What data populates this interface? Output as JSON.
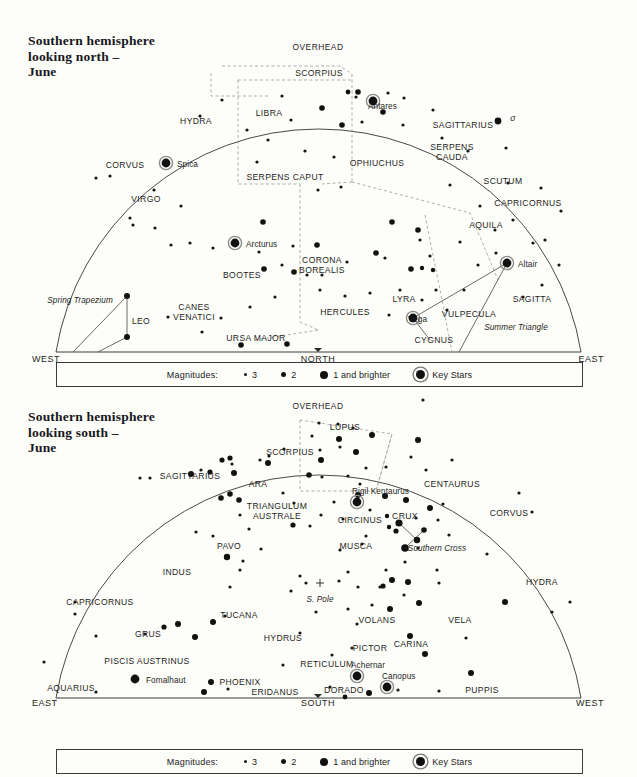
{
  "page": {
    "background": "#fdfdfa",
    "ink": "#1a1a1a"
  },
  "legend": {
    "title": "Magnitudes:",
    "items": [
      {
        "name": "mag-3",
        "label": "3",
        "size": "m3"
      },
      {
        "name": "mag-2",
        "label": "2",
        "size": "m2"
      },
      {
        "name": "mag-1",
        "label": "1 and brighter",
        "size": "m1"
      },
      {
        "name": "key-stars",
        "label": "Key Stars",
        "size": "key"
      }
    ]
  },
  "chart_data": [
    {
      "type": "scatter",
      "id": "north",
      "title": "Southern hemisphere\nlooking north –\nJune",
      "zenith_label": "OVERHEAD",
      "horizon_labels": {
        "left": "WEST",
        "center": "NORTH",
        "right": "EAST"
      },
      "xlabel": "",
      "ylabel": "",
      "grid": false,
      "legend_position": "below",
      "constellations": [
        {
          "name": "HYDRA",
          "x": 196,
          "y": 121
        },
        {
          "name": "LIBRA",
          "x": 269,
          "y": 113
        },
        {
          "name": "SCORPIUS",
          "x": 319,
          "y": 73
        },
        {
          "name": "SAGITTARIUS",
          "x": 463,
          "y": 125
        },
        {
          "name": "CORVUS",
          "x": 125,
          "y": 165
        },
        {
          "name": "VIRGO",
          "x": 146,
          "y": 199
        },
        {
          "name": "SERPENS CAPUT",
          "x": 285,
          "y": 177
        },
        {
          "name": "OPHIUCHUS",
          "x": 377,
          "y": 163
        },
        {
          "name": "SERPENS\nCAUDA",
          "x": 452,
          "y": 153
        },
        {
          "name": "SCUTUM",
          "x": 503,
          "y": 181
        },
        {
          "name": "CAPRICORNUS",
          "x": 528,
          "y": 203
        },
        {
          "name": "AQUILA",
          "x": 486,
          "y": 225
        },
        {
          "name": "BOOTES",
          "x": 242,
          "y": 275
        },
        {
          "name": "CORONA\nBOREALIS",
          "x": 322,
          "y": 266
        },
        {
          "name": "HERCULES",
          "x": 345,
          "y": 312
        },
        {
          "name": "LYRA",
          "x": 404,
          "y": 299
        },
        {
          "name": "VULPECULA",
          "x": 469,
          "y": 314
        },
        {
          "name": "SAGITTA",
          "x": 532,
          "y": 299
        },
        {
          "name": "CYGNUS",
          "x": 434,
          "y": 340
        },
        {
          "name": "LEO",
          "x": 141,
          "y": 321
        },
        {
          "name": "CANES\nVENATICI",
          "x": 194,
          "y": 313
        },
        {
          "name": "URSA MAJOR",
          "x": 256,
          "y": 338
        }
      ],
      "named_stars": [
        {
          "name": "Antares",
          "x": 373,
          "y": 101,
          "label_x": 368,
          "label_y": 106,
          "mag": "key"
        },
        {
          "name": "Spica",
          "x": 166,
          "y": 163,
          "label_x": 177,
          "label_y": 164,
          "mag": "key"
        },
        {
          "name": "Arcturus",
          "x": 235,
          "y": 243,
          "label_x": 246,
          "label_y": 244,
          "mag": "key"
        },
        {
          "name": "Altair",
          "x": 507,
          "y": 263,
          "label_x": 518,
          "label_y": 264,
          "mag": "key"
        },
        {
          "name": "Vega",
          "x": 413,
          "y": 318,
          "label_x": 408,
          "label_y": 319,
          "mag": "key"
        }
      ],
      "asterisms": [
        {
          "name": "Spring Trapezium",
          "x": 80,
          "y": 300
        },
        {
          "name": "Summer Triangle",
          "x": 516,
          "y": 327
        }
      ],
      "planets": [
        {
          "symbol": "σ",
          "x": 513,
          "y": 118
        }
      ]
    },
    {
      "type": "scatter",
      "id": "south",
      "title": "Southern hemisphere\nlooking south –\nJune",
      "zenith_label": "OVERHEAD",
      "horizon_labels": {
        "left": "EAST",
        "center": "SOUTH",
        "right": "WEST"
      },
      "xlabel": "",
      "ylabel": "",
      "grid": false,
      "legend_position": "below",
      "pole_marker": {
        "label": "S. Pole",
        "x": 320,
        "y": 592
      },
      "constellations": [
        {
          "name": "SCORPIUS",
          "x": 290,
          "y": 452
        },
        {
          "name": "LUPUS",
          "x": 345,
          "y": 427
        },
        {
          "name": "SAGITTARIUS",
          "x": 190,
          "y": 476
        },
        {
          "name": "ARA",
          "x": 258,
          "y": 484
        },
        {
          "name": "CENTAURUS",
          "x": 452,
          "y": 484
        },
        {
          "name": "TRIANGULUM\nAUSTRALE",
          "x": 277,
          "y": 512
        },
        {
          "name": "CIRCINUS",
          "x": 360,
          "y": 520
        },
        {
          "name": "CRUX",
          "x": 405,
          "y": 516
        },
        {
          "name": "CORVUS",
          "x": 509,
          "y": 513
        },
        {
          "name": "MUSCA",
          "x": 356,
          "y": 546
        },
        {
          "name": "PAVO",
          "x": 229,
          "y": 546
        },
        {
          "name": "INDUS",
          "x": 177,
          "y": 572
        },
        {
          "name": "HYDRA",
          "x": 542,
          "y": 582
        },
        {
          "name": "CAPRICORNUS",
          "x": 100,
          "y": 602
        },
        {
          "name": "TUCANA",
          "x": 239,
          "y": 615
        },
        {
          "name": "VOLANS",
          "x": 377,
          "y": 620
        },
        {
          "name": "VELA",
          "x": 460,
          "y": 620
        },
        {
          "name": "GRUS",
          "x": 148,
          "y": 634
        },
        {
          "name": "HYDRUS",
          "x": 283,
          "y": 638
        },
        {
          "name": "PICTOR",
          "x": 370,
          "y": 648
        },
        {
          "name": "CARINA",
          "x": 411,
          "y": 644
        },
        {
          "name": "RETICULUM",
          "x": 327,
          "y": 664
        },
        {
          "name": "PISCIS AUSTRINUS",
          "x": 147,
          "y": 661
        },
        {
          "name": "PHOENIX",
          "x": 240,
          "y": 682
        },
        {
          "name": "ERIDANUS",
          "x": 275,
          "y": 692
        },
        {
          "name": "DORADO",
          "x": 344,
          "y": 690
        },
        {
          "name": "PUPPIS",
          "x": 482,
          "y": 690
        },
        {
          "name": "AQUARIUS",
          "x": 71,
          "y": 688
        }
      ],
      "named_stars": [
        {
          "name": "Rigil Kentaurus",
          "x": 357,
          "y": 502,
          "label_x": 352,
          "label_y": 491,
          "mag": "key"
        },
        {
          "name": "Achernar",
          "x": 357,
          "y": 676,
          "label_x": 351,
          "label_y": 665,
          "mag": "key"
        },
        {
          "name": "Fomalhaut",
          "x": 135,
          "y": 679,
          "label_x": 146,
          "label_y": 680,
          "mag": "key"
        },
        {
          "name": "Canopus",
          "x": 387,
          "y": 687,
          "label_x": 382,
          "label_y": 676,
          "mag": "key"
        }
      ],
      "asterisms": [
        {
          "name": "Southern Cross",
          "x": 437,
          "y": 548
        }
      ],
      "planets": []
    }
  ]
}
